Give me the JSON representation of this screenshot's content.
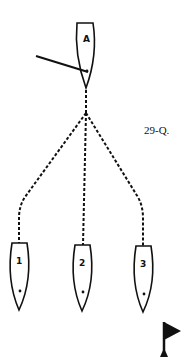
{
  "figure": {
    "label": "29-Q."
  },
  "boats": [
    {
      "id": "A",
      "label": "A"
    },
    {
      "id": "1",
      "label": "1"
    },
    {
      "id": "2",
      "label": "2"
    },
    {
      "id": "3",
      "label": "3"
    }
  ],
  "icons": {
    "flag": "mark-flag-icon"
  },
  "colors": {
    "stroke": "#111111",
    "background": "#ffffff"
  }
}
